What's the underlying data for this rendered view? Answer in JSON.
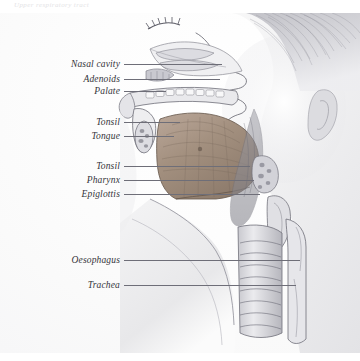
{
  "figure": {
    "top_caption": "Upper respiratory tract",
    "style": "grayscale pencil medical illustration"
  },
  "colors": {
    "background": "#ffffff",
    "label_text": "#34343a",
    "leader_line": "#6e6e78",
    "ink_dark": "#5b5b63",
    "ink_mid": "#8e8e96",
    "ink_light": "#c4c4ca",
    "tongue_warm": "#a79385",
    "tissue_shadow": "#9a9aa2"
  },
  "labels": [
    {
      "id": "nasal-cavity",
      "text": "Nasal cavity",
      "text_right": 120,
      "text_top": 59,
      "leader_x": 124,
      "leader_w": 98,
      "leader_y": 64
    },
    {
      "id": "adenoids",
      "text": "Adenoids",
      "text_right": 120,
      "text_top": 74,
      "leader_x": 124,
      "leader_w": 96,
      "leader_y": 79
    },
    {
      "id": "palate",
      "text": "Palate",
      "text_right": 120,
      "text_top": 86,
      "leader_x": 124,
      "leader_w": 42,
      "leader_y": 91
    },
    {
      "id": "tonsil-upper",
      "text": "Tonsil",
      "text_right": 120,
      "text_top": 117,
      "leader_x": 124,
      "leader_w": 56,
      "leader_y": 122
    },
    {
      "id": "tongue",
      "text": "Tongue",
      "text_right": 120,
      "text_top": 131,
      "leader_x": 124,
      "leader_w": 50,
      "leader_y": 136
    },
    {
      "id": "tonsil-lower",
      "text": "Tonsil",
      "text_right": 120,
      "text_top": 161,
      "leader_x": 124,
      "leader_w": 126,
      "leader_y": 166
    },
    {
      "id": "pharynx",
      "text": "Pharynx",
      "text_right": 120,
      "text_top": 175,
      "leader_x": 124,
      "leader_w": 130,
      "leader_y": 180
    },
    {
      "id": "epiglottis",
      "text": "Epiglottis",
      "text_right": 120,
      "text_top": 189,
      "leader_x": 124,
      "leader_w": 136,
      "leader_y": 194
    },
    {
      "id": "oesophagus",
      "text": "Oesophagus",
      "text_right": 120,
      "text_top": 255,
      "leader_x": 124,
      "leader_w": 176,
      "leader_y": 260
    },
    {
      "id": "trachea",
      "text": "Trachea",
      "text_right": 120,
      "text_top": 280,
      "leader_x": 124,
      "leader_w": 172,
      "leader_y": 285
    }
  ]
}
